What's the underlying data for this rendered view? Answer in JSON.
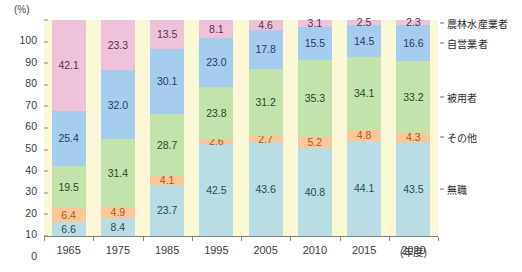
{
  "chart_data": {
    "type": "bar",
    "stacked": true,
    "stack_total": 100,
    "title": "",
    "xlabel": "(年度)",
    "ylabel": "(%)",
    "ylim": [
      0,
      100
    ],
    "yticks": [
      0,
      10,
      20,
      30,
      40,
      50,
      60,
      70,
      80,
      90,
      100
    ],
    "grid": false,
    "legend_position": "right",
    "categories": [
      "1965",
      "1975",
      "1985",
      "1995",
      "2005",
      "2010",
      "2015",
      "2020"
    ],
    "series": [
      {
        "name": "無職",
        "color": "#b9dde2",
        "text_color": "#2e4a52",
        "values": [
          6.6,
          8.4,
          23.7,
          42.5,
          43.6,
          40.8,
          44.1,
          43.5
        ]
      },
      {
        "name": "その他",
        "color": "#f9c79a",
        "text_color": "#b4531d",
        "values": [
          6.4,
          4.9,
          4.1,
          2.6,
          2.7,
          5.2,
          4.8,
          4.3
        ]
      },
      {
        "name": "被用者",
        "color": "#c3e3ab",
        "text_color": "#2b4a26",
        "values": [
          19.5,
          31.4,
          28.7,
          23.8,
          31.2,
          35.3,
          34.1,
          33.2
        ]
      },
      {
        "name": "自営業者",
        "color": "#a6cdee",
        "text_color": "#1f3d63",
        "values": [
          25.4,
          32.0,
          30.1,
          23.0,
          17.8,
          15.5,
          14.5,
          16.6
        ]
      },
      {
        "name": "農林水産業者",
        "color": "#eec3da",
        "text_color": "#5c3149",
        "values": [
          42.1,
          23.3,
          13.5,
          8.1,
          4.6,
          3.1,
          2.5,
          2.3
        ]
      }
    ],
    "legend_entries": [
      {
        "label": "農林水産業者",
        "color": "#eec3da"
      },
      {
        "label": "自営業者",
        "color": "#a6cdee"
      },
      {
        "label": "被用者",
        "color": "#c3e3ab"
      },
      {
        "label": "その他",
        "color": "#f9c79a"
      },
      {
        "label": "無職",
        "color": "#b9dde2"
      }
    ],
    "plot_background": "#fbf8d8"
  }
}
